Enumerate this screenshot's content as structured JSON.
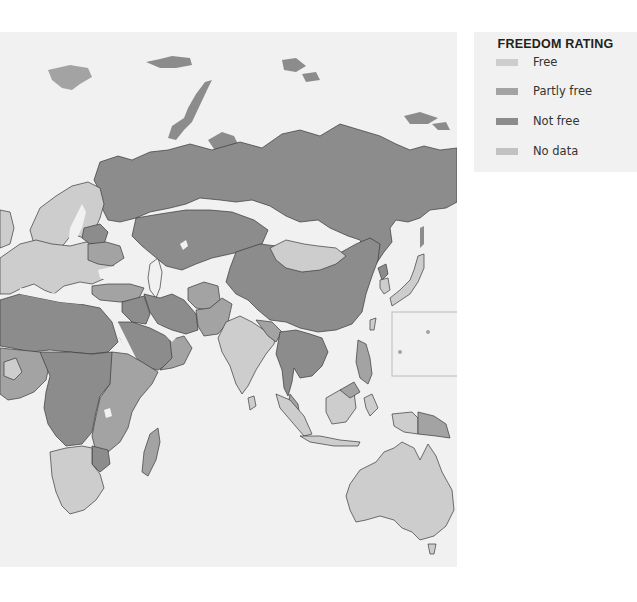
{
  "legend": {
    "title": "FREEDOM RATING",
    "items": [
      {
        "key": "free",
        "label": "Free",
        "color": "#cdcdcd"
      },
      {
        "key": "partly_free",
        "label": "Partly free",
        "color": "#a3a3a3"
      },
      {
        "key": "not_free",
        "label": "Not free",
        "color": "#8c8c8c"
      },
      {
        "key": "no_data",
        "label": "No data",
        "color": "#c2c2c2"
      }
    ]
  },
  "map": {
    "ocean_color": "#f1f1f1",
    "regions": [
      {
        "name": "Russia",
        "rating": "not_free"
      },
      {
        "name": "Scandinavia",
        "rating": "free"
      },
      {
        "name": "Western Europe",
        "rating": "free"
      },
      {
        "name": "Eastern Europe",
        "rating": "free"
      },
      {
        "name": "Belarus",
        "rating": "not_free"
      },
      {
        "name": "Ukraine",
        "rating": "partly_free"
      },
      {
        "name": "Turkey",
        "rating": "partly_free"
      },
      {
        "name": "Central Asia",
        "rating": "not_free"
      },
      {
        "name": "Mongolia",
        "rating": "free"
      },
      {
        "name": "China",
        "rating": "not_free"
      },
      {
        "name": "India",
        "rating": "free"
      },
      {
        "name": "Afghanistan",
        "rating": "partly_free"
      },
      {
        "name": "Middle East",
        "rating": "not_free"
      },
      {
        "name": "North Africa",
        "rating": "not_free"
      },
      {
        "name": "West Africa",
        "rating": "partly_free"
      },
      {
        "name": "Central Africa",
        "rating": "not_free"
      },
      {
        "name": "East Africa",
        "rating": "partly_free"
      },
      {
        "name": "Southern Africa",
        "rating": "free"
      },
      {
        "name": "Madagascar",
        "rating": "partly_free"
      },
      {
        "name": "Southeast Asia",
        "rating": "not_free"
      },
      {
        "name": "Indonesia",
        "rating": "free"
      },
      {
        "name": "Philippines",
        "rating": "partly_free"
      },
      {
        "name": "Japan",
        "rating": "free"
      },
      {
        "name": "South Korea",
        "rating": "free"
      },
      {
        "name": "Papua New Guinea",
        "rating": "partly_free"
      },
      {
        "name": "Australia",
        "rating": "free"
      },
      {
        "name": "Sri Lanka",
        "rating": "free"
      }
    ]
  }
}
